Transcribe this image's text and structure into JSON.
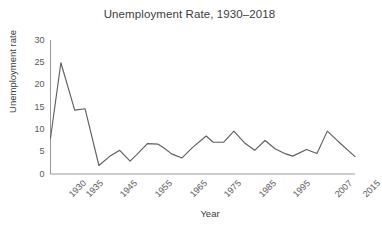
{
  "chart_data": {
    "type": "line",
    "title": "Unemployment Rate, 1930–2018",
    "xlabel": "Year",
    "ylabel": "Unemployment rate",
    "ylim": [
      0,
      30
    ],
    "ytick_labels": [
      "30",
      "25",
      "20",
      "15",
      "10",
      "5",
      "0"
    ],
    "yticks": [
      30,
      25,
      20,
      15,
      10,
      5,
      0
    ],
    "xtick_labels": [
      "1930",
      "1935",
      "1945",
      "1955",
      "1965",
      "1975",
      "1985",
      "1995",
      "2007",
      "2015"
    ],
    "xticks": [
      1930,
      1935,
      1945,
      1955,
      1965,
      1975,
      1985,
      1995,
      2007,
      2015
    ],
    "grid": false,
    "legend": "none",
    "series": [
      {
        "name": "Unemployment rate",
        "x": [
          1930,
          1933,
          1937,
          1940,
          1944,
          1947,
          1950,
          1953,
          1955,
          1958,
          1961,
          1963,
          1965,
          1968,
          1971,
          1975,
          1977,
          1980,
          1983,
          1986,
          1989,
          1992,
          1995,
          1998,
          2000,
          2004,
          2007,
          2010,
          2013,
          2018
        ],
        "values": [
          8.0,
          24.9,
          14.3,
          14.6,
          1.9,
          3.9,
          5.3,
          2.9,
          4.4,
          6.8,
          6.7,
          5.7,
          4.5,
          3.6,
          5.9,
          8.5,
          7.1,
          7.1,
          9.6,
          7.0,
          5.3,
          7.5,
          5.6,
          4.5,
          4.0,
          5.5,
          4.6,
          9.6,
          7.4,
          3.9
        ]
      }
    ]
  },
  "colors": {
    "line": "#5f5f5f",
    "axis": "#9a9a9a",
    "text": "#3b3b3b",
    "tick_text": "#595959",
    "background": "#ffffff"
  }
}
